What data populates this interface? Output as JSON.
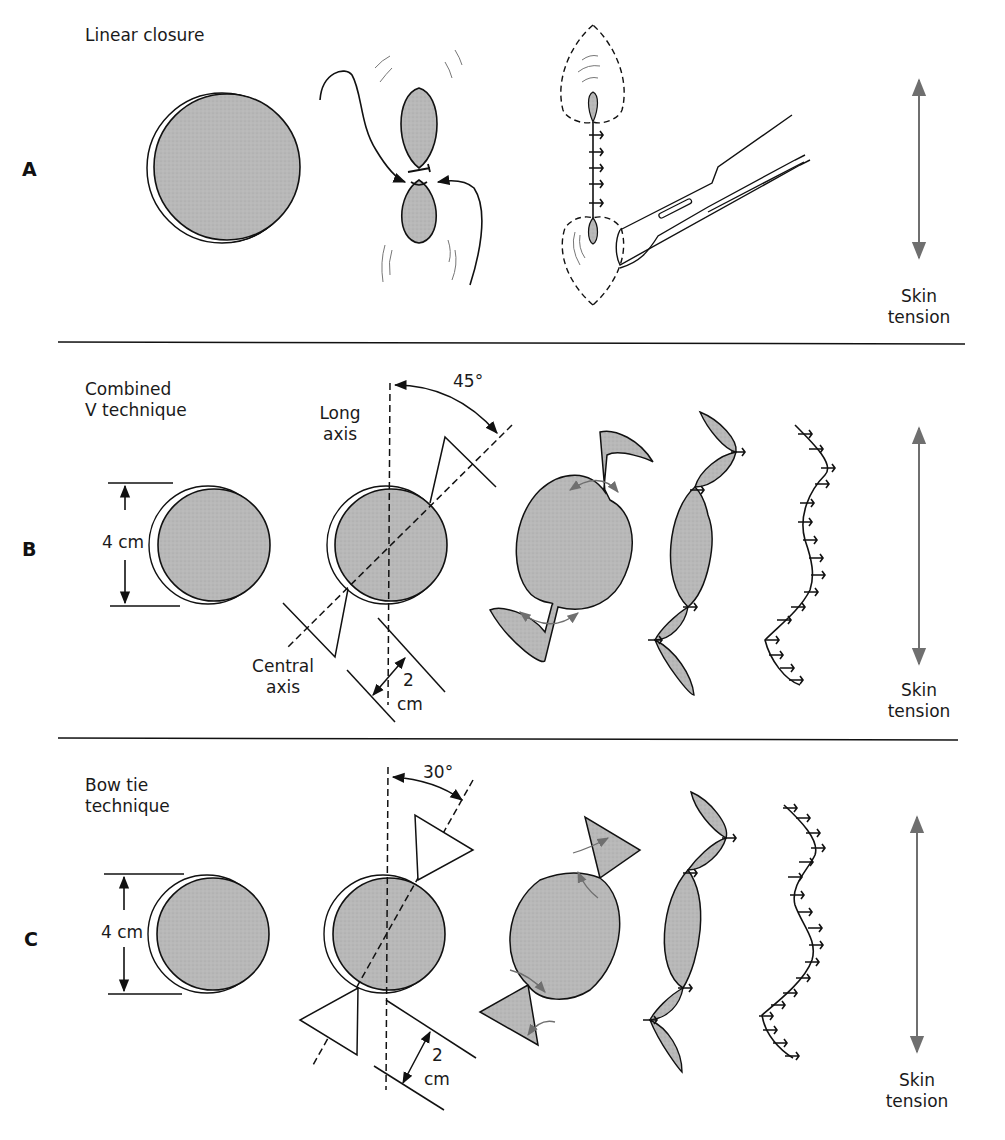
{
  "figure": {
    "colors": {
      "tissue_fill": "#b8b8b8",
      "ink": "#1a1a1a",
      "arrow_gray": "#6f6f6f",
      "background": "#ffffff"
    },
    "panels": [
      {
        "letter": "A",
        "title": "Linear closure",
        "tension_label": "Skin\ntension"
      },
      {
        "letter": "B",
        "title": "Combined\nV technique",
        "diameter_label": "4 cm",
        "long_axis_label": "Long\naxis",
        "central_axis_label": "Central\naxis",
        "angle_label": "45°",
        "offset_value": "2",
        "offset_unit": "cm",
        "tension_label": "Skin\ntension"
      },
      {
        "letter": "C",
        "title": "Bow tie\ntechnique",
        "diameter_label": "4 cm",
        "angle_label": "30°",
        "offset_value": "2",
        "offset_unit": "cm",
        "tension_label": "Skin\ntension"
      }
    ]
  }
}
